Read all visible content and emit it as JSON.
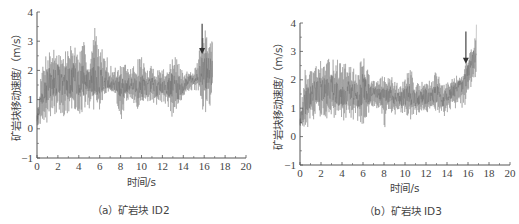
{
  "chart_data": [
    {
      "type": "line",
      "caption": "（a）矿岩块 ID2",
      "xlabel": "时间/s",
      "ylabel": "矿岩块移动速度/（m/s）",
      "xlim": [
        0,
        20
      ],
      "ylim": [
        -1,
        4
      ],
      "xticks": [
        0,
        2,
        4,
        6,
        8,
        10,
        12,
        14,
        16,
        18,
        20
      ],
      "yticks": [
        -1,
        0,
        1,
        2,
        3,
        4
      ],
      "grid": false,
      "legend": null,
      "annotation": {
        "type": "arrow-down",
        "x": 15.8,
        "y_from": 3.6,
        "y_to": 2.6
      },
      "series": [
        {
          "name": "矿岩块 ID2",
          "color": "#888888",
          "x": [
            0,
            0.5,
            1,
            1.5,
            2,
            2.5,
            3,
            3.5,
            4,
            4.5,
            5,
            5.5,
            6,
            6.5,
            7,
            7.5,
            8,
            8.5,
            9,
            9.5,
            10,
            10.5,
            11,
            11.5,
            12,
            12.5,
            13,
            13.5,
            14,
            14.5,
            15,
            15.5,
            16,
            16.5,
            16.8
          ],
          "upper": [
            0.6,
            2.2,
            2.8,
            2.8,
            2.8,
            2.5,
            2.9,
            3.0,
            2.6,
            3.0,
            2.2,
            3.6,
            2.8,
            2.7,
            2.2,
            2.1,
            2.2,
            2.2,
            2.1,
            2.3,
            2.6,
            2.0,
            2.2,
            2.1,
            2.1,
            2.1,
            2.5,
            2.4,
            1.9,
            2.0,
            2.0,
            2.6,
            3.6,
            2.8,
            3.3
          ],
          "lower": [
            0.1,
            0.2,
            0.2,
            0.5,
            0.5,
            0.4,
            0.4,
            0.5,
            0.5,
            0.6,
            0.7,
            0.4,
            0.5,
            1.2,
            1.3,
            1.2,
            0.1,
            0.9,
            1.0,
            0.6,
            0.6,
            0.9,
            0.9,
            0.8,
            0.9,
            0.8,
            0.3,
            0.6,
            1.0,
            1.2,
            1.3,
            1.3,
            0.4,
            0.7,
            1.0
          ],
          "mean": [
            0.3,
            1.2,
            1.5,
            1.6,
            1.7,
            1.6,
            1.6,
            1.7,
            1.6,
            1.7,
            1.6,
            1.8,
            1.7,
            1.7,
            1.5,
            1.5,
            1.4,
            1.5,
            1.5,
            1.4,
            1.5,
            1.4,
            1.5,
            1.4,
            1.5,
            1.4,
            1.5,
            1.4,
            1.4,
            1.7,
            1.7,
            1.8,
            2.0,
            1.9,
            2.0
          ]
        }
      ]
    },
    {
      "type": "line",
      "caption": "（b）矿岩块 ID3",
      "xlabel": "时间/s",
      "ylabel": "矿岩块移动速度/（m/s）",
      "xlim": [
        0,
        20
      ],
      "ylim": [
        -1,
        4
      ],
      "xticks": [
        0,
        2,
        4,
        6,
        8,
        10,
        12,
        14,
        16,
        18,
        20
      ],
      "yticks": [
        -1,
        0,
        1,
        2,
        3,
        4
      ],
      "grid": false,
      "legend": null,
      "annotation": {
        "type": "arrow-down",
        "x": 15.8,
        "y_from": 3.7,
        "y_to": 2.6
      },
      "series": [
        {
          "name": "矿岩块 ID3",
          "color": "#888888",
          "x": [
            0,
            0.5,
            1,
            1.5,
            2,
            2.5,
            3,
            3.5,
            4,
            4.5,
            5,
            5.5,
            6,
            6.5,
            7,
            7.5,
            8,
            8.5,
            9,
            9.5,
            10,
            10.5,
            11,
            11.5,
            12,
            12.5,
            13,
            13.5,
            14,
            14.5,
            15,
            15.5,
            16,
            16.5,
            16.8
          ],
          "upper": [
            0.7,
            2.4,
            2.3,
            2.5,
            2.7,
            2.6,
            2.9,
            2.8,
            2.5,
            2.7,
            2.4,
            2.4,
            3.0,
            2.3,
            2.0,
            2.0,
            2.2,
            2.2,
            2.0,
            1.8,
            2.1,
            2.5,
            1.9,
            1.9,
            2.1,
            1.9,
            2.4,
            1.8,
            1.9,
            2.1,
            2.2,
            2.2,
            2.9,
            3.3,
            4.3
          ],
          "lower": [
            0.3,
            0.1,
            0.4,
            0.6,
            0.7,
            0.6,
            0.7,
            0.6,
            0.5,
            0.6,
            0.6,
            0.5,
            0.4,
            0.7,
            1.0,
            1.0,
            0.2,
            0.9,
            0.7,
            0.8,
            0.7,
            0.6,
            0.7,
            0.8,
            0.8,
            0.8,
            0.9,
            0.6,
            0.8,
            1.0,
            0.9,
            1.0,
            1.2,
            2.0,
            1.8
          ],
          "mean": [
            0.5,
            1.2,
            1.4,
            1.6,
            1.7,
            1.6,
            1.7,
            1.6,
            1.5,
            1.6,
            1.5,
            1.4,
            1.7,
            1.5,
            1.5,
            1.5,
            1.3,
            1.5,
            1.3,
            1.3,
            1.4,
            1.5,
            1.3,
            1.4,
            1.4,
            1.4,
            1.5,
            1.3,
            1.4,
            1.6,
            1.7,
            1.8,
            2.2,
            2.7,
            3.0
          ]
        }
      ]
    }
  ],
  "panels": [
    {
      "caption": "（a）矿岩块 ID2",
      "xlabel": "时间/s",
      "ylabel": "矿岩块移动速度/（m/s）"
    },
    {
      "caption": "（b）矿岩块 ID3",
      "xlabel": "时间/s",
      "ylabel": "矿岩块移动速度/（m/s）"
    }
  ],
  "colors": {
    "axis": "#555555",
    "signal": "#8a8a8a",
    "arrow": "#333333"
  }
}
